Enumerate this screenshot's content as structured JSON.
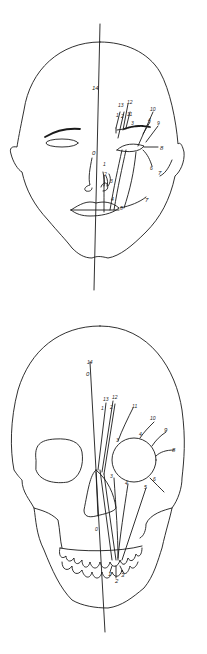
{
  "diagram": {
    "panels": [
      {
        "id": "face",
        "subject": "face-outline",
        "midline_label": "14",
        "reference_point": "0",
        "labels": [
          {
            "text": "14",
            "x": 93,
            "y": 89
          },
          {
            "text": "0",
            "x": 92,
            "y": 154
          },
          {
            "text": "13",
            "x": 118,
            "y": 106
          },
          {
            "text": "12",
            "x": 127,
            "y": 103
          },
          {
            "text": "1",
            "x": 117,
            "y": 115
          },
          {
            "text": "2",
            "x": 122,
            "y": 116
          },
          {
            "text": "11",
            "x": 128,
            "y": 114
          },
          {
            "text": "3",
            "x": 131,
            "y": 124
          },
          {
            "text": "10",
            "x": 151,
            "y": 110
          },
          {
            "text": "4",
            "x": 148,
            "y": 121
          },
          {
            "text": "9",
            "x": 157,
            "y": 124
          },
          {
            "text": "8",
            "x": 161,
            "y": 149
          },
          {
            "text": "6",
            "x": 150,
            "y": 169
          },
          {
            "text": "7",
            "x": 162,
            "y": 173
          },
          {
            "text": "1",
            "x": 104,
            "y": 165
          },
          {
            "text": "2",
            "x": 104,
            "y": 175
          },
          {
            "text": "3",
            "x": 111,
            "y": 182
          },
          {
            "text": "4",
            "x": 112,
            "y": 200
          },
          {
            "text": "5",
            "x": 121,
            "y": 208
          },
          {
            "text": "7",
            "x": 145,
            "y": 201
          }
        ]
      },
      {
        "id": "skull",
        "subject": "skull-outline",
        "midline_label": "14",
        "reference_point": "0",
        "labels": [
          {
            "text": "14",
            "x": 89,
            "y": 363
          },
          {
            "text": "0",
            "x": 88,
            "y": 374
          },
          {
            "text": "13",
            "x": 104,
            "y": 400
          },
          {
            "text": "12",
            "x": 113,
            "y": 398
          },
          {
            "text": "1",
            "x": 103,
            "y": 409
          },
          {
            "text": "2",
            "x": 112,
            "y": 408
          },
          {
            "text": "11",
            "x": 133,
            "y": 408
          },
          {
            "text": "3",
            "x": 118,
            "y": 440
          },
          {
            "text": "10",
            "x": 151,
            "y": 420
          },
          {
            "text": "4",
            "x": 140,
            "y": 434
          },
          {
            "text": "9",
            "x": 166,
            "y": 430
          },
          {
            "text": "8",
            "x": 174,
            "y": 450
          },
          {
            "text": "3",
            "x": 112,
            "y": 477
          },
          {
            "text": "4",
            "x": 126,
            "y": 484
          },
          {
            "text": "5",
            "x": 145,
            "y": 487
          },
          {
            "text": "6",
            "x": 155,
            "y": 480
          },
          {
            "text": "0",
            "x": 97,
            "y": 530
          },
          {
            "text": "1",
            "x": 110,
            "y": 573
          },
          {
            "text": "2",
            "x": 117,
            "y": 580
          },
          {
            "text": "3",
            "x": 123,
            "y": 574
          }
        ]
      }
    ]
  }
}
